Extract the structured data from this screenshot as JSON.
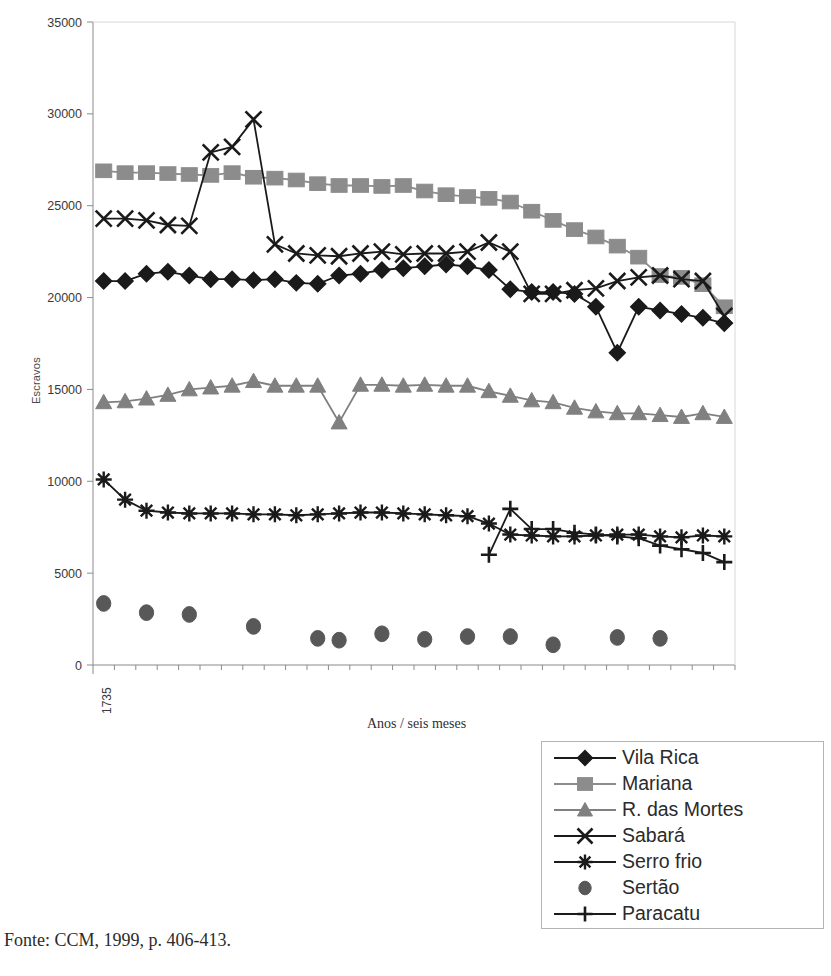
{
  "figure": {
    "source_note": "Fonte: CCM, 1999, p. 406-413."
  },
  "chart_data": {
    "type": "line",
    "title": "",
    "xlabel": "Anos / seis meses",
    "ylabel": "Escravos",
    "ylim": [
      0,
      35000
    ],
    "ytick_step": 5000,
    "yticks": [
      "0",
      "5000",
      "10000",
      "15000",
      "20000",
      "25000",
      "30000",
      "35000"
    ],
    "grid": false,
    "legend_position": "bottom-right",
    "x_start_label": "1735",
    "xtick_labels": [
      "1735"
    ],
    "x_points": 30,
    "x_note": "Semestral observations beginning 1735; only the first category is labelled on the axis.",
    "colors": {
      "vila_rica": "#1a1a1a",
      "mariana": "#8c8c8c",
      "r_das_mortes": "#808080",
      "sabara": "#1a1a1a",
      "serro_frio": "#1a1a1a",
      "sertao": "#585858",
      "paracatu": "#1a1a1a",
      "axis": "#8a8a8a",
      "background": "#ffffff"
    },
    "series": [
      {
        "name": "Vila Rica",
        "marker": "diamond",
        "color": "#1a1a1a",
        "line": true,
        "values": [
          20900,
          20900,
          21300,
          21400,
          21200,
          21000,
          21000,
          20950,
          21000,
          20800,
          20750,
          21200,
          21300,
          21500,
          21600,
          21700,
          21800,
          21700,
          21500,
          20450,
          20300,
          20300,
          20200,
          19500,
          17000,
          19500,
          19300,
          19100,
          18900,
          18600
        ]
      },
      {
        "name": "Mariana",
        "marker": "square",
        "color": "#8c8c8c",
        "line": true,
        "values": [
          26900,
          26800,
          26800,
          26750,
          26700,
          26650,
          26800,
          26550,
          26500,
          26400,
          26200,
          26100,
          26100,
          26050,
          26100,
          25800,
          25600,
          25500,
          25400,
          25200,
          24700,
          24200,
          23700,
          23300,
          22800,
          22200,
          21200,
          21100,
          20700,
          19500
        ]
      },
      {
        "name": "R. das Mortes",
        "marker": "triangle",
        "color": "#808080",
        "line": true,
        "values": [
          14300,
          14350,
          14500,
          14700,
          15000,
          15100,
          15200,
          15450,
          15200,
          15200,
          15200,
          13200,
          15250,
          15250,
          15200,
          15250,
          15200,
          15200,
          14900,
          14650,
          14400,
          14300,
          14000,
          13800,
          13700,
          13700,
          13600,
          13500,
          13700,
          13500
        ]
      },
      {
        "name": "Sabará",
        "marker": "x",
        "color": "#1a1a1a",
        "line": true,
        "values": [
          24300,
          24300,
          24200,
          23950,
          23900,
          27900,
          28200,
          29700,
          22900,
          22400,
          22300,
          22250,
          22400,
          22500,
          22350,
          22400,
          22400,
          22500,
          23000,
          22500,
          20200,
          20200,
          20400,
          20500,
          20900,
          21100,
          21200,
          21000,
          20900,
          19000
        ]
      },
      {
        "name": "Serro frio",
        "marker": "star",
        "color": "#1a1a1a",
        "line": true,
        "values": [
          10100,
          9000,
          8400,
          8300,
          8250,
          8250,
          8250,
          8200,
          8200,
          8150,
          8200,
          8250,
          8300,
          8300,
          8250,
          8200,
          8150,
          8100,
          7700,
          7100,
          7050,
          7000,
          7000,
          7050,
          7100,
          7100,
          7000,
          6950,
          7050,
          7000
        ]
      },
      {
        "name": "Sertão",
        "marker": "circle",
        "color": "#585858",
        "line": false,
        "values": [
          3350,
          null,
          2850,
          null,
          2750,
          null,
          null,
          2100,
          null,
          null,
          1450,
          1350,
          null,
          1700,
          null,
          1400,
          null,
          1550,
          null,
          1550,
          null,
          1100,
          null,
          null,
          1500,
          null,
          1450,
          null,
          null,
          null
        ]
      },
      {
        "name": "Paracatu",
        "marker": "plus",
        "color": "#1a1a1a",
        "line": true,
        "values": [
          null,
          null,
          null,
          null,
          null,
          null,
          null,
          null,
          null,
          null,
          null,
          null,
          null,
          null,
          null,
          null,
          null,
          null,
          6000,
          8500,
          7400,
          7400,
          7200,
          7100,
          7000,
          6900,
          6500,
          6300,
          6100,
          5600
        ]
      }
    ]
  },
  "legend": {
    "items": [
      {
        "label": "Vila Rica",
        "marker": "diamond",
        "color": "#1a1a1a",
        "line": true
      },
      {
        "label": "Mariana",
        "marker": "square",
        "color": "#8c8c8c",
        "line": true
      },
      {
        "label": "R. das Mortes",
        "marker": "triangle",
        "color": "#808080",
        "line": true
      },
      {
        "label": "Sabará",
        "marker": "x",
        "color": "#1a1a1a",
        "line": true
      },
      {
        "label": "Serro frio",
        "marker": "star",
        "color": "#1a1a1a",
        "line": true
      },
      {
        "label": "Sertão",
        "marker": "circle",
        "color": "#585858",
        "line": false
      },
      {
        "label": "Paracatu",
        "marker": "plus",
        "color": "#1a1a1a",
        "line": true
      }
    ]
  }
}
